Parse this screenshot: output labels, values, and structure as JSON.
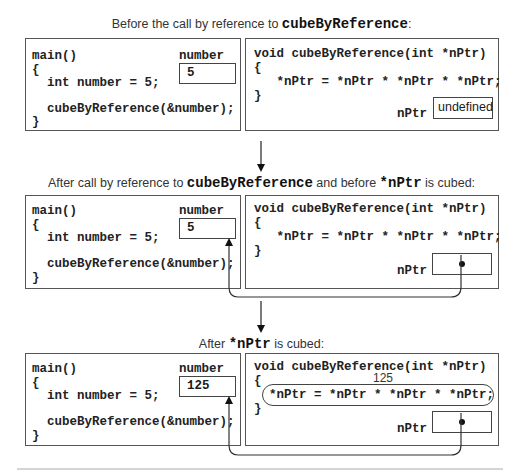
{
  "stages": [
    {
      "caption": {
        "pre": "Before the call by reference to ",
        "code1": "cubeByReference",
        "mid": "",
        "code2": "",
        "post": ":"
      },
      "main_code": [
        "main()",
        "{",
        "  int number = 5;",
        "",
        "  cubeByReference(&number);",
        "}"
      ],
      "number_label": "number",
      "number_value": "5",
      "func_code": [
        "void cubeByReference(int *nPtr)",
        "{",
        "   *nPtr = *nPtr * *nPtr * *nPtr;",
        "}"
      ],
      "nptr_label": "nPtr",
      "nptr_value": "undefined"
    },
    {
      "caption": {
        "pre": "After call by reference to ",
        "code1": "cubeByReference",
        "mid": " and before ",
        "code2": "*nPtr",
        "post": " is cubed:"
      },
      "main_code": [
        "main()",
        "{",
        "  int number = 5;",
        "",
        "  cubeByReference(&number);",
        "}"
      ],
      "number_label": "number",
      "number_value": "5",
      "func_code": [
        "void cubeByReference(int *nPtr)",
        "{",
        "   *nPtr = *nPtr * *nPtr * *nPtr;",
        "}"
      ],
      "nptr_label": "nPtr",
      "nptr_value": "pointer to number"
    },
    {
      "caption": {
        "pre": "After ",
        "code1": "*nPtr",
        "mid": "",
        "code2": "",
        "post": "  is cubed:"
      },
      "main_code": [
        "main()",
        "{",
        "  int number = 5;",
        "",
        "  cubeByReference(&number);",
        "}"
      ],
      "number_label": "number",
      "number_value": "125",
      "func_code": [
        "void cubeByReference(int *nPtr)",
        "{",
        "  *nPtr = *nPtr * *nPtr * *nPtr;",
        "}"
      ],
      "nptr_label": "nPtr",
      "nptr_value": "pointer to number",
      "result_note": "125"
    }
  ]
}
